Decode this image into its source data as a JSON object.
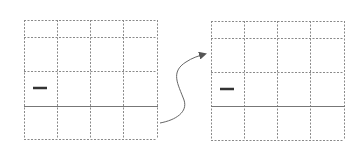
{
  "diagram": {
    "type": "grid-transformation",
    "colors": {
      "grid_dashed": "#8a8a8a",
      "solid_line": "#777777",
      "marker": "#333333",
      "arrow": "#666666"
    },
    "left_grid": {
      "x": 24,
      "y": 20,
      "width": 133,
      "height": 119,
      "columns": [
        24,
        57,
        90,
        123,
        157
      ],
      "rows": [
        20,
        37,
        71,
        106,
        139
      ],
      "solid_row": 106,
      "marker": {
        "x1": 33,
        "x2": 47,
        "y": 88
      }
    },
    "right_grid": {
      "x": 211,
      "y": 21,
      "width": 133,
      "height": 119,
      "columns": [
        211,
        244,
        277,
        310,
        344
      ],
      "rows": [
        21,
        38,
        72,
        106,
        140
      ],
      "solid_row": 106,
      "marker": {
        "x1": 220,
        "x2": 234,
        "y": 89
      }
    },
    "arrow": {
      "from": [
        160,
        123
      ],
      "to": [
        205,
        54
      ],
      "direction": "left-to-right"
    }
  }
}
